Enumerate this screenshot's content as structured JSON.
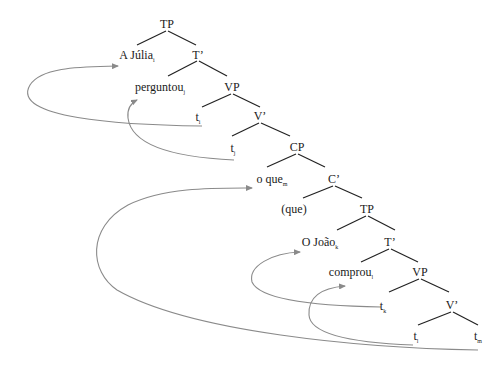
{
  "diagram": {
    "type": "syntax-tree",
    "nodes": {
      "tp1": {
        "label": "TP",
        "sub": ""
      },
      "subj1": {
        "label": "A Júlia",
        "sub": "i"
      },
      "tbar1": {
        "label": "T’",
        "sub": ""
      },
      "verb1": {
        "label": "perguntou",
        "sub": "j"
      },
      "vp1": {
        "label": "VP",
        "sub": ""
      },
      "trace_i": {
        "label": "t",
        "sub": "i"
      },
      "vbar1": {
        "label": "V’",
        "sub": ""
      },
      "trace_j": {
        "label": "t",
        "sub": "j"
      },
      "cp": {
        "label": "CP",
        "sub": ""
      },
      "wh": {
        "label": "o que",
        "sub": "m"
      },
      "cbar": {
        "label": "C’",
        "sub": ""
      },
      "comp": {
        "label": "(que)",
        "sub": ""
      },
      "tp2": {
        "label": "TP",
        "sub": ""
      },
      "subj2": {
        "label": "O João",
        "sub": "k"
      },
      "tbar2": {
        "label": "T’",
        "sub": ""
      },
      "verb2": {
        "label": "comprou",
        "sub": "l"
      },
      "vp2": {
        "label": "VP",
        "sub": ""
      },
      "trace_k": {
        "label": "t",
        "sub": "k"
      },
      "vbar2": {
        "label": "V’",
        "sub": ""
      },
      "trace_l": {
        "label": "t",
        "sub": "l"
      },
      "trace_m": {
        "label": "t",
        "sub": "m"
      }
    },
    "movement_arrows": [
      {
        "from": "t_i",
        "to": "A Júlia_i"
      },
      {
        "from": "t_j",
        "to": "perguntou_j"
      },
      {
        "from": "t_m",
        "to": "o que_m"
      },
      {
        "from": "t_k",
        "to": "O João_k"
      },
      {
        "from": "t_l",
        "to": "comprou_l"
      }
    ],
    "colors": {
      "tree_lines": "#222222",
      "arrows": "#8a8a8a"
    }
  }
}
